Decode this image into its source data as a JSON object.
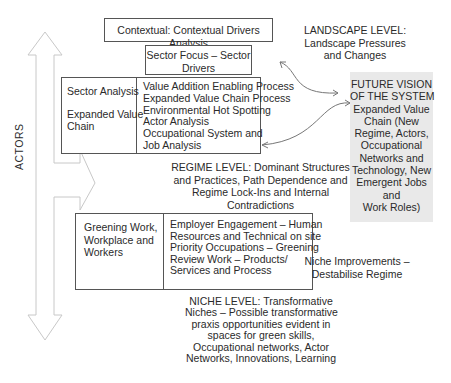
{
  "diagram": {
    "contextual_box": {
      "text": "Contextual: Contextual Drivers Analysis"
    },
    "sector_focus_box": {
      "lines": [
        "Sector Focus – Sector",
        "Drivers"
      ]
    },
    "sector_analysis_box": {
      "left_lines": [
        "Sector Analysis",
        "",
        "Expanded Value",
        "Chain"
      ],
      "right_lines": [
        "Value Addition Enabling Process",
        "Expanded Value Chain Process",
        "Environmental Hot Spotting",
        "Actor Analysis",
        "Occupational System and",
        "Job Analysis"
      ]
    },
    "greening_box": {
      "left_lines": [
        "Greening Work,",
        "Workplace and",
        "Workers"
      ],
      "right_lines": [
        "Employer Engagement – Human",
        "Resources and Technical on site",
        "Priority Occupations – Greening",
        "Review Work – Products/",
        "Services and Process"
      ]
    },
    "landscape_label": {
      "lines": [
        "LANDSCAPE LEVEL:",
        "Landscape Pressures",
        "and Changes"
      ]
    },
    "future_vision": {
      "lines": [
        "FUTURE VISION",
        "OF THE SYSTEM",
        "Expanded Value",
        "Chain (New",
        "Regime, Actors,",
        "Occupational",
        "Networks and",
        "Technology, New",
        "Emergent Jobs",
        "and",
        "Work Roles)"
      ],
      "background": "#e9e9e9"
    },
    "regime_label": {
      "lines": [
        "REGIME LEVEL: Dominant Structures",
        "and Practices, Path Dependence and",
        "Regime Lock-Ins and Internal",
        "Contradictions"
      ]
    },
    "niche_improvements_label": {
      "lines": [
        "Niche Improvements –",
        "Destabilise Regime"
      ]
    },
    "niche_label": {
      "lines": [
        "NICHE LEVEL: Transformative",
        "Niches – Possible transformative",
        "praxis opportunities evident in",
        "spaces for green skills,",
        "Occupational networks, Actor",
        "Networks, Innovations, Learning"
      ]
    },
    "actors_label": {
      "text": "ACTORS"
    },
    "colors": {
      "border": "#555555",
      "arrow_outline": "#c8c8c8",
      "connector": "#777777",
      "text": "#2a2a2a"
    }
  }
}
